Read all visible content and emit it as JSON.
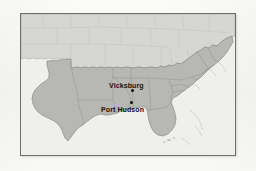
{
  "figure": {
    "kind": "historical-map",
    "page_background": "#f7f7f6",
    "frame_border_color": "#6e6e6c"
  },
  "map": {
    "water_color": "#efefed",
    "union_land_color": "#d6d6d3",
    "confederate_land_color": "#b7b7b3",
    "border_line_color": "#8f8f8c",
    "state_line_color": "#b9b9b5",
    "coast_line_color": "#9a9a97",
    "marker_color": "#0d0d0d",
    "label_color": "#141414"
  },
  "cities": [
    {
      "name": "Vicksburg",
      "label": "Vicksburg",
      "label_x": 88,
      "label_y": 68,
      "dot_x": 110,
      "dot_y": 75
    },
    {
      "name": "Port Hudson",
      "label": "Port Hudson",
      "label_x": 80,
      "label_y": 92,
      "dot_x": 109,
      "dot_y": 87
    }
  ]
}
